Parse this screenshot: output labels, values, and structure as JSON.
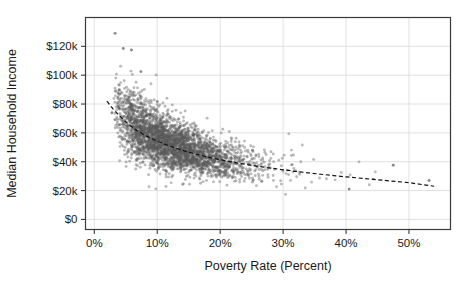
{
  "chart_data": {
    "type": "scatter",
    "title": "",
    "xlabel": "Poverty Rate (Percent)",
    "ylabel": "Median Household Income",
    "xlim": [
      -1.4,
      56.6
    ],
    "ylim": [
      -7000,
      140000
    ],
    "xticks": [
      0,
      10,
      20,
      30,
      40,
      50
    ],
    "xticklabels": [
      "0%",
      "10%",
      "20%",
      "30%",
      "40%",
      "50%"
    ],
    "yticks": [
      0,
      20000,
      40000,
      60000,
      80000,
      100000,
      120000
    ],
    "yticklabels": [
      "$0",
      "$20k",
      "$40k",
      "$60k",
      "$80k",
      "$100k",
      "$120k"
    ],
    "grid": true,
    "grid_color": "#d9d9d9",
    "legend": "none",
    "point_color": "#5a5a5a",
    "point_opacity": 0.42,
    "point_radius": 1.45,
    "trendline": {
      "style": "dashed",
      "color": "#111111",
      "width": 1.2,
      "description": "Downward-curving dashed fit line from about 2% poverty / $82k income to about 54% poverty / $23k income",
      "points": [
        [
          2.0,
          82000
        ],
        [
          3.0,
          76500
        ],
        [
          4.0,
          71800
        ],
        [
          5.0,
          67600
        ],
        [
          6.0,
          64000
        ],
        [
          7.0,
          61000
        ],
        [
          8.0,
          58400
        ],
        [
          9.0,
          56200
        ],
        [
          10.0,
          54200
        ],
        [
          11.0,
          52400
        ],
        [
          12.0,
          50800
        ],
        [
          13.0,
          49300
        ],
        [
          14.0,
          47900
        ],
        [
          15.0,
          46600
        ],
        [
          16.0,
          45400
        ],
        [
          17.0,
          44300
        ],
        [
          18.0,
          43300
        ],
        [
          19.0,
          42300
        ],
        [
          20.0,
          41400
        ],
        [
          21.0,
          40500
        ],
        [
          22.0,
          39700
        ],
        [
          23.0,
          38900
        ],
        [
          24.0,
          38200
        ],
        [
          25.0,
          37500
        ],
        [
          26.0,
          36800
        ],
        [
          27.0,
          36200
        ],
        [
          28.0,
          35600
        ],
        [
          29.0,
          35000
        ],
        [
          30.0,
          34400
        ],
        [
          32.0,
          33300
        ],
        [
          34.0,
          32300
        ],
        [
          36.0,
          31300
        ],
        [
          38.0,
          30400
        ],
        [
          40.0,
          29500
        ],
        [
          42.0,
          28700
        ],
        [
          44.0,
          27900
        ],
        [
          46.0,
          27100
        ],
        [
          48.0,
          26300
        ],
        [
          50.0,
          25500
        ],
        [
          52.0,
          24200
        ],
        [
          54.0,
          23000
        ]
      ]
    },
    "series": [
      {
        "name": "counties",
        "n_points": 3141,
        "x_range": [
          1.6,
          53.5
        ],
        "y_range": [
          15000,
          129000
        ],
        "notable_points": [
          [
            3.3,
            129000
          ],
          [
            4.6,
            118500
          ],
          [
            5.9,
            117500
          ],
          [
            7.4,
            102500
          ],
          [
            2.8,
            74000
          ],
          [
            47.5,
            37500
          ],
          [
            53.2,
            27000
          ],
          [
            40.5,
            21000
          ]
        ],
        "description": "Dense negatively-correlated cloud of US county observations; income falls steeply from roughly $90k at low poverty rates to about $25k-$30k at poverty rates above 30%."
      }
    ]
  },
  "axes": {
    "x_axis_name": "poverty-rate-axis",
    "y_axis_name": "median-household-income-axis"
  }
}
